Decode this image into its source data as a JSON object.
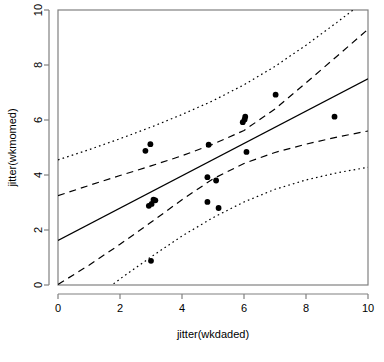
{
  "chart_data": {
    "type": "scatter",
    "title": "",
    "xlabel": "jitter(wkdaded)",
    "ylabel": "jitter(wkmomed)",
    "xlim": [
      0,
      10
    ],
    "ylim": [
      0,
      10
    ],
    "xticks": [
      0,
      2,
      4,
      6,
      8,
      10
    ],
    "yticks": [
      0,
      2,
      4,
      6,
      8,
      10
    ],
    "xtick_labels": [
      "0",
      "2",
      "4",
      "6",
      "8",
      "10"
    ],
    "ytick_labels": [
      "0",
      "2",
      "4",
      "6",
      "8",
      "10"
    ],
    "grid": false,
    "legend": false,
    "legend_position": "none",
    "point_color": "#000000",
    "point_size": 4.0,
    "points": [
      {
        "x": 2.82,
        "y": 4.88
      },
      {
        "x": 2.98,
        "y": 5.12
      },
      {
        "x": 2.93,
        "y": 2.88
      },
      {
        "x": 3.02,
        "y": 2.95
      },
      {
        "x": 3.08,
        "y": 3.1
      },
      {
        "x": 3.14,
        "y": 3.08
      },
      {
        "x": 3.0,
        "y": 0.88
      },
      {
        "x": 4.82,
        "y": 3.92
      },
      {
        "x": 4.86,
        "y": 5.1
      },
      {
        "x": 4.82,
        "y": 3.02
      },
      {
        "x": 5.1,
        "y": 3.8
      },
      {
        "x": 5.18,
        "y": 2.8
      },
      {
        "x": 5.96,
        "y": 5.92
      },
      {
        "x": 6.02,
        "y": 6.02
      },
      {
        "x": 6.04,
        "y": 6.12
      },
      {
        "x": 6.08,
        "y": 4.84
      },
      {
        "x": 7.02,
        "y": 6.92
      },
      {
        "x": 8.92,
        "y": 6.12
      }
    ],
    "series": [
      {
        "name": "regression-line",
        "style": "solid",
        "color": "#000000",
        "points": [
          {
            "x": 0.0,
            "y": 1.62
          },
          {
            "x": 10.0,
            "y": 7.5
          }
        ]
      },
      {
        "name": "confidence-band-upper",
        "style": "dashed",
        "color": "#000000",
        "points": [
          {
            "x": 0.0,
            "y": 3.25
          },
          {
            "x": 1.0,
            "y": 3.62
          },
          {
            "x": 2.0,
            "y": 3.98
          },
          {
            "x": 3.0,
            "y": 4.33
          },
          {
            "x": 4.0,
            "y": 4.7
          },
          {
            "x": 5.0,
            "y": 5.12
          },
          {
            "x": 6.0,
            "y": 5.62
          },
          {
            "x": 7.0,
            "y": 6.4
          },
          {
            "x": 8.0,
            "y": 7.35
          },
          {
            "x": 9.0,
            "y": 8.32
          },
          {
            "x": 10.0,
            "y": 9.3
          }
        ]
      },
      {
        "name": "confidence-band-lower",
        "style": "dashed",
        "color": "#000000",
        "points": [
          {
            "x": 0.0,
            "y": 0.02
          },
          {
            "x": 1.0,
            "y": 0.72
          },
          {
            "x": 2.0,
            "y": 1.48
          },
          {
            "x": 3.0,
            "y": 2.28
          },
          {
            "x": 4.0,
            "y": 3.1
          },
          {
            "x": 5.0,
            "y": 3.86
          },
          {
            "x": 6.0,
            "y": 4.42
          },
          {
            "x": 7.0,
            "y": 4.82
          },
          {
            "x": 8.0,
            "y": 5.12
          },
          {
            "x": 9.0,
            "y": 5.38
          },
          {
            "x": 10.0,
            "y": 5.6
          }
        ]
      },
      {
        "name": "prediction-band-upper",
        "style": "dotted",
        "color": "#000000",
        "points": [
          {
            "x": 0.0,
            "y": 4.55
          },
          {
            "x": 1.0,
            "y": 4.92
          },
          {
            "x": 2.0,
            "y": 5.32
          },
          {
            "x": 3.0,
            "y": 5.74
          },
          {
            "x": 4.0,
            "y": 6.2
          },
          {
            "x": 5.0,
            "y": 6.7
          },
          {
            "x": 6.0,
            "y": 7.28
          },
          {
            "x": 7.0,
            "y": 7.95
          },
          {
            "x": 8.0,
            "y": 8.72
          },
          {
            "x": 9.0,
            "y": 9.55
          },
          {
            "x": 10.0,
            "y": 10.42
          }
        ]
      },
      {
        "name": "prediction-band-lower",
        "style": "dotted",
        "color": "#000000",
        "points": [
          {
            "x": 1.3,
            "y": -0.38
          },
          {
            "x": 2.0,
            "y": 0.22
          },
          {
            "x": 3.0,
            "y": 1.02
          },
          {
            "x": 4.0,
            "y": 1.78
          },
          {
            "x": 5.0,
            "y": 2.45
          },
          {
            "x": 6.0,
            "y": 3.02
          },
          {
            "x": 7.0,
            "y": 3.48
          },
          {
            "x": 8.0,
            "y": 3.82
          },
          {
            "x": 9.0,
            "y": 4.08
          },
          {
            "x": 10.0,
            "y": 4.28
          }
        ]
      }
    ]
  }
}
